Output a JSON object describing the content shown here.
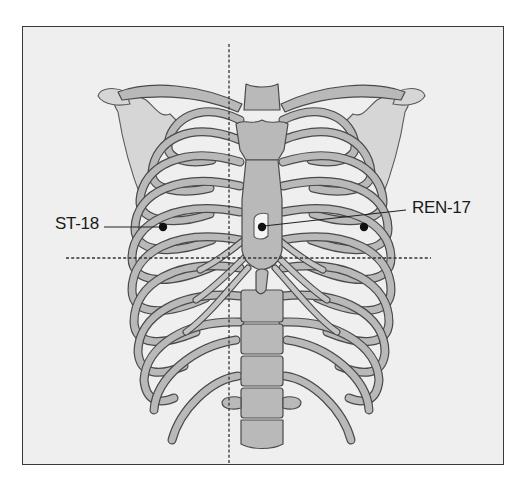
{
  "figure": {
    "colors": {
      "background": "#efefef",
      "frame": "#3a3a3a",
      "bone_fill": "#b9b9b9",
      "bone_outline": "#4a4a4a",
      "point": "#111111"
    },
    "labels": [
      {
        "id": "st18",
        "text": "ST-18",
        "side": "left"
      },
      {
        "id": "ren17",
        "text": "REN-17",
        "side": "right"
      }
    ],
    "points": [
      {
        "id": "st18-left",
        "label": "ST-18",
        "x": 163,
        "y": 227
      },
      {
        "id": "ren17",
        "label": "REN-17",
        "x": 262,
        "y": 227
      },
      {
        "id": "st18-right",
        "label": "ST-18",
        "x": 364,
        "y": 227
      }
    ],
    "reference_lines": [
      {
        "id": "midline-vertical",
        "orientation": "vertical",
        "x": 229,
        "y1": 44,
        "y2": 465
      },
      {
        "id": "horizontal",
        "orientation": "horizontal",
        "y": 258,
        "x1": 66,
        "x2": 431
      }
    ]
  }
}
